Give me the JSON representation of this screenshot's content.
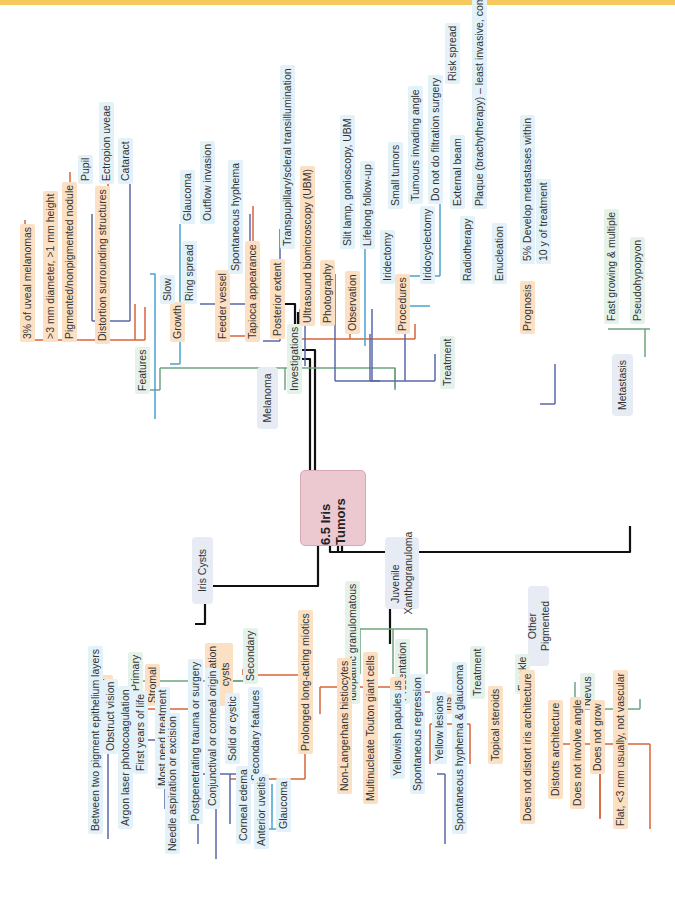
{
  "title": "6.5 Iris Tumors",
  "colors": {
    "level1_line": "#111111",
    "level2_line": "#6fa57f",
    "level3_line": "#d8663a",
    "level4_line": "#5a6aa8",
    "level5_line": "#4aa3cf",
    "root_fill": "#ecc9d1",
    "category_fill": "#e6ebf4",
    "orange_fill": "#fbe0c4",
    "blue_fill": "#e3f1f8",
    "green_fill": "#e5f2ea"
  },
  "melanoma": {
    "label": "Melanoma",
    "features": {
      "label": "Features",
      "items": [
        "3% of uveal melanomas",
        ">3 mm diameter, >1 mm height",
        "Pigmented/nonpigmented nodule",
        "Distortion surrounding structures",
        "Growth",
        "Feeder vessel",
        "Tapioca appearance"
      ],
      "distortion": {
        "pupil": "Pupil",
        "ectropion": "Ectropion uveae",
        "cataract": "Cataract"
      },
      "growth": {
        "slow": "Slow",
        "ring_spread": "Ring spread",
        "glaucoma": "Glaucoma",
        "outflow": "Outflow invasion"
      },
      "feeder": {
        "hyphema": "Spontaneous hyphema"
      }
    },
    "investigations": {
      "label": "Investigations",
      "posterior": "Posterior extent",
      "transillumination": "Transpupillary/scleral transillumination",
      "ubm": "Ultrasound biomicroscopy (UBM)",
      "photography": "Photography"
    },
    "treatment": {
      "label": "Treatment",
      "observation": "Observation",
      "slit_lamp": "Slit lamp, gonioscopy, UBM",
      "lifelong": "Lifelong follow-up",
      "procedures": "Procedures",
      "iridectomy": "Iridectomy",
      "small_tumors": "Small tumors",
      "iridocyclectomy": "Iridocyclectomy",
      "tumours_angle": "Tumours invading angle",
      "no_filtration": "Do not do filtration surgery",
      "risk_spread": "Risk spread",
      "radiotherapy": "Radiotherapy",
      "external_beam": "External beam",
      "plaque": "Plaque (brachytherapy) – least invasive, common",
      "enucleation": "Enucleation",
      "prognosis": "Prognosis",
      "prognosis_text_1": "5% Develop metastases within",
      "prognosis_text_2": "10 y of treatment"
    }
  },
  "metastasis": {
    "label": "Metastasis",
    "items": [
      "Fast growing & multiple",
      "Pseudohypopyon"
    ]
  },
  "iris_cysts": {
    "label": "Iris Cysts",
    "primary": {
      "label": "Primary",
      "epithelial": "Epithelial",
      "between_layers": "Between two pigment epithelium layers",
      "obstruct_vision": "Obstruct vision",
      "argon": "Argon laser photocoagulation",
      "stromal": "Stromal",
      "first_years": "First years of life",
      "most_need": "Most need treatment",
      "needle": "Needle aspiration or excision"
    },
    "secondary": {
      "label": "Secondary",
      "implantation_1": "Implantation",
      "implantation_2": "cysts",
      "postpenetrating": "Postpenetrating trauma or surgery",
      "conjunctival": "Conjunctival or corneal origin",
      "solid_cystic": "Solid or cystic",
      "secondary_features": "Secondary features",
      "corneal_edema": "Corneal edema",
      "anterior_uveitis": "Anterior uveitis",
      "glaucoma": "Glaucoma",
      "miotics": "Prolonged long-acting miotics"
    }
  },
  "jxg": {
    "label_1": "Juvenile",
    "label_2": "Xanthogranuloma",
    "idiopathic": "Idiopathic granulomatous",
    "non_langerhans": "Non-Langerhans histiocytes",
    "touton": "Multinucleate Touton giant cells",
    "presentation": "Presentation",
    "cutaneous": "Cutaneous",
    "yellowish_papules": "Yellowish papules",
    "spontaneous_regression": "Spontaneous regression",
    "iris": "Iris",
    "yellow_lesions": "Yellow lesions",
    "hyphema_glaucoma": "Spontaneous hyphema & glaucoma",
    "treatment": "Treatment",
    "topical_steroids": "Topical steroids"
  },
  "other_pigmented": {
    "label": "Other Pigmented",
    "freckle": "Freckle",
    "freckle_item": "Does not distort iris architecture",
    "nevus": "Nevus",
    "nevus_items": [
      "Distorts architecture",
      "Does not involve angle",
      "Does not grow",
      "Flat, <3 mm usually, not vascular"
    ]
  }
}
